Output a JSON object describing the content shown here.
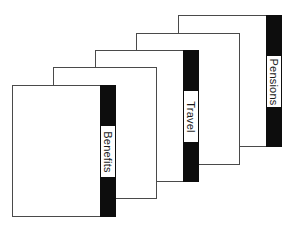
{
  "diagram": {
    "colors": {
      "card_border": "#4a4a4a",
      "tab_bar": "#0d0d0d",
      "card_fill": "#ffffff"
    },
    "cards": [
      {
        "position": 1,
        "left": 178,
        "top": 15,
        "has_tab": true,
        "label": "Pensions"
      },
      {
        "position": 2,
        "left": 136,
        "top": 33,
        "has_tab": false,
        "label": ""
      },
      {
        "position": 3,
        "left": 95,
        "top": 50,
        "has_tab": true,
        "label": "Travel"
      },
      {
        "position": 4,
        "left": 53,
        "top": 67,
        "has_tab": false,
        "label": ""
      },
      {
        "position": 5,
        "left": 12,
        "top": 85,
        "has_tab": true,
        "label": "Benefits"
      }
    ]
  }
}
